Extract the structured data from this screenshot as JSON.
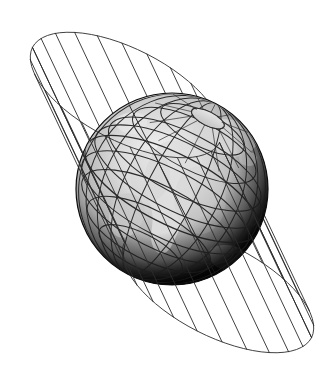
{
  "figure": {
    "background_color": "#ffffff",
    "line_color": "#2b2b2b",
    "width": 333,
    "height": 377
  },
  "globe": {
    "name": "earth-globe",
    "center_x": 172,
    "center_y": 189,
    "radius": 96,
    "axis_tilt_degrees": 27,
    "limb_shadow_color": "#0d0d0d",
    "ocean_color": "#b9b9b9",
    "land_color": "#e2e2e2",
    "graticule_color": "#1c1c1c",
    "pole_cap_color": "#d6d6d6",
    "meridian_count": 24,
    "parallel_count": 8,
    "visible_pole": "north"
  },
  "cylinder": {
    "name": "tangent-cylinder",
    "axis_tilt_degrees": 27,
    "ruling_count": 24,
    "top_cap": {
      "center_x": 126,
      "center_y": 95,
      "rx": 105,
      "ry": 46,
      "rotation_degrees": 27
    },
    "bottom_cap": {
      "center_x": 218,
      "center_y": 290,
      "rx": 105,
      "ry": 46,
      "rotation_degrees": 27
    },
    "stroke_width": 0.9
  },
  "labels": {
    "figure_caption": "",
    "alt_text": "A wireframe cylinder drawn around a shaded globe showing latitude and longitude lines, illustrating a tangent cylindrical map projection."
  }
}
